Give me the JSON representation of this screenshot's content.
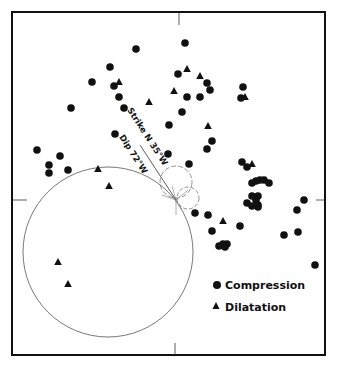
{
  "figure": {
    "type": "focal-mechanism-plot",
    "colors": {
      "ink": "#111111",
      "circle": "#555555",
      "background": "#ffffff"
    },
    "frame": {
      "x": 12,
      "y": 12,
      "width": 313,
      "height": 343
    },
    "center": {
      "x": 176,
      "y": 200
    },
    "annotations": {
      "strike": "Strike N 35°W",
      "dip": "Dip 72°W"
    },
    "legend": [
      {
        "symbol": "circle",
        "label": "Compression"
      },
      {
        "symbol": "triangle",
        "label": "Dilatation"
      }
    ],
    "nodal_circle": {
      "cx": 108,
      "cy": 252,
      "r": 85
    },
    "compression_points": [
      [
        185,
        43
      ],
      [
        178,
        74
      ],
      [
        207,
        83
      ],
      [
        210,
        90
      ],
      [
        187,
        97
      ],
      [
        200,
        97
      ],
      [
        182,
        112
      ],
      [
        243,
        87
      ],
      [
        241,
        98
      ],
      [
        136,
        49
      ],
      [
        110,
        67
      ],
      [
        92,
        82
      ],
      [
        114,
        86
      ],
      [
        119,
        97
      ],
      [
        71,
        108
      ],
      [
        124,
        108
      ],
      [
        169,
        125
      ],
      [
        212,
        141
      ],
      [
        207,
        149
      ],
      [
        168,
        154
      ],
      [
        189,
        164
      ],
      [
        115,
        134
      ],
      [
        37,
        150
      ],
      [
        60,
        156
      ],
      [
        49,
        165
      ],
      [
        49,
        173
      ],
      [
        68,
        170
      ],
      [
        242,
        162
      ],
      [
        247,
        167
      ],
      [
        252,
        183
      ],
      [
        256,
        181
      ],
      [
        260,
        180
      ],
      [
        264,
        180
      ],
      [
        269,
        183
      ],
      [
        252,
        196
      ],
      [
        258,
        196
      ],
      [
        256,
        200
      ],
      [
        247,
        203
      ],
      [
        252,
        206
      ],
      [
        258,
        205
      ],
      [
        258,
        207
      ],
      [
        304,
        200
      ],
      [
        297,
        210
      ],
      [
        284,
        235
      ],
      [
        298,
        232
      ],
      [
        315,
        265
      ],
      [
        195,
        213
      ],
      [
        208,
        215
      ],
      [
        212,
        231
      ],
      [
        240,
        226
      ],
      [
        219,
        246
      ],
      [
        223,
        244
      ],
      [
        225,
        247
      ],
      [
        227,
        244
      ]
    ],
    "dilatation_points": [
      [
        187,
        69
      ],
      [
        200,
        76
      ],
      [
        174,
        91
      ],
      [
        245,
        97
      ],
      [
        119,
        82
      ],
      [
        149,
        102
      ],
      [
        208,
        126
      ],
      [
        252,
        164
      ],
      [
        98,
        169
      ],
      [
        109,
        186
      ],
      [
        223,
        221
      ],
      [
        58,
        262
      ],
      [
        68,
        284
      ]
    ]
  }
}
